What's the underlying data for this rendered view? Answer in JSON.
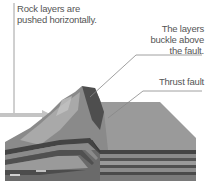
{
  "diagram": {
    "labels": {
      "push": "Rock layers are pushed horizontally.",
      "push_line1": "Rock layers are",
      "push_line2": "pushed horizontally.",
      "buckle_line1": "The layers",
      "buckle_line2": "buckle above",
      "buckle_line3": "the fault.",
      "fault": "Thrust fault"
    },
    "colors": {
      "text": "#555555",
      "leader_line": "#888888",
      "arrow": "#bdbdbd",
      "surface_light": "#a8a8a8",
      "surface_dark": "#6e6e6e",
      "layer_dark": "#4a4a4a",
      "layer_mid": "#7a7a7a",
      "layer_light": "#9c9c9c"
    }
  }
}
